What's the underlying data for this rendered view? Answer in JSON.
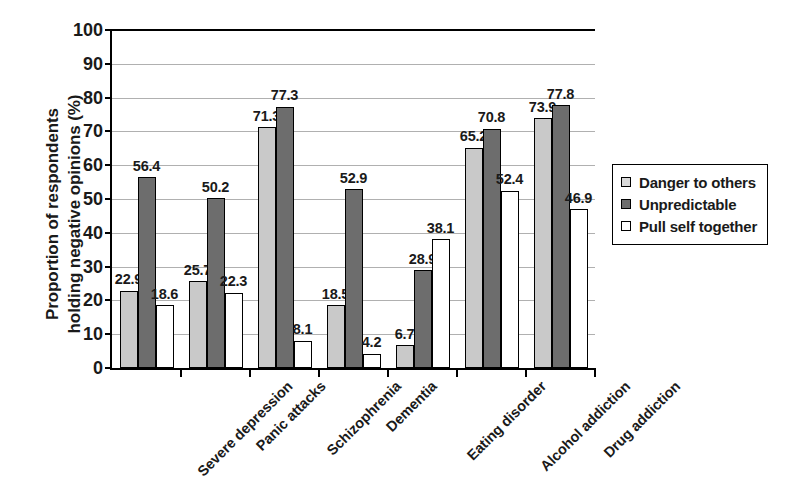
{
  "chart_data": {
    "type": "bar",
    "title": "",
    "xlabel": "",
    "ylabel_line1": "Proportion of respondents",
    "ylabel_line2": "holding negative opinions (%)",
    "ylim": [
      0,
      100
    ],
    "ytick_step": 10,
    "yticks": [
      "0",
      "10",
      "20",
      "30",
      "40",
      "50",
      "60",
      "70",
      "80",
      "90",
      "100"
    ],
    "grid": true,
    "legend_position": "right",
    "categories": [
      "Severe depression",
      "Panic attacks",
      "Schizophrenia",
      "Dementia",
      "Eating disorder",
      "Alcohol addiction",
      "Drug addiction"
    ],
    "series": [
      {
        "name": "Danger to others",
        "color": "#c9c9c9",
        "values": [
          22.9,
          25.7,
          71.3,
          18.5,
          6.7,
          65.2,
          73.9
        ],
        "labels": [
          "22.9",
          "25.7",
          "71.3",
          "18.5",
          "6.7",
          "65.2",
          "73.9"
        ]
      },
      {
        "name": "Unpredictable",
        "color": "#6d6d6d",
        "values": [
          56.4,
          50.2,
          77.3,
          52.9,
          28.9,
          70.8,
          77.8
        ],
        "labels": [
          "56.4",
          "50.2",
          "77.3",
          "52.9",
          "28.9",
          "70.8",
          "77.8"
        ]
      },
      {
        "name": "Pull self together",
        "color": "#ffffff",
        "values": [
          18.6,
          22.3,
          8.1,
          4.2,
          38.1,
          52.4,
          46.9
        ],
        "labels": [
          "18.6",
          "22.3",
          "8.1",
          "4.2",
          "38.1",
          "52.4",
          "46.9"
        ]
      }
    ]
  },
  "legend": {
    "items": [
      {
        "label": "Danger to others"
      },
      {
        "label": "Unpredictable"
      },
      {
        "label": "Pull self together"
      }
    ]
  }
}
